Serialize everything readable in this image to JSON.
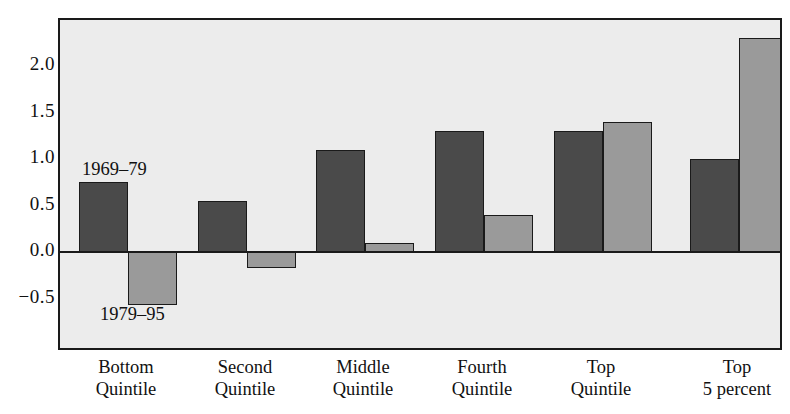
{
  "chart_data": {
    "type": "bar",
    "title": "",
    "xlabel": "",
    "ylabel": "",
    "categories": [
      "Bottom Quintile",
      "Second Quintile",
      "Middle Quintile",
      "Fourth Quintile",
      "Top Quintile",
      "Top 5 percent"
    ],
    "category_lines": [
      [
        "Bottom",
        "Quintile"
      ],
      [
        "Second",
        "Quintile"
      ],
      [
        "Middle",
        "Quintile"
      ],
      [
        "Fourth",
        "Quintile"
      ],
      [
        "Top",
        "Quintile"
      ],
      [
        "Top",
        "5 percent"
      ]
    ],
    "series": [
      {
        "name": "1969–79",
        "color": "#4a4a4a",
        "values": [
          0.75,
          0.55,
          1.1,
          1.3,
          1.3,
          1.0
        ]
      },
      {
        "name": "1979–95",
        "color": "#9a9a9a",
        "values": [
          -0.57,
          -0.17,
          0.1,
          0.4,
          1.4,
          2.3
        ]
      }
    ],
    "ylim": [
      -0.72,
      2.45
    ],
    "yticks": [
      2.0,
      1.5,
      1.0,
      0.5,
      0.0,
      -0.5
    ],
    "ytick_labels": [
      "2.0",
      "1.5",
      "1.0",
      "0.5",
      "0.0",
      "−0.5"
    ],
    "grid": false,
    "legend_position": "inline-annotations",
    "annotations": [
      {
        "text": "1969–79",
        "series": "1969–79",
        "category": "Bottom Quintile",
        "placement": "above-bar"
      },
      {
        "text": "1979–95",
        "series": "1979–95",
        "category": "Bottom Quintile",
        "placement": "below-bar"
      }
    ]
  },
  "style": {
    "plot_background": "#ececec",
    "frame_color": "#1a1a1a",
    "page_background": "#ffffff",
    "series_colors": [
      "#4a4a4a",
      "#9a9a9a"
    ]
  }
}
